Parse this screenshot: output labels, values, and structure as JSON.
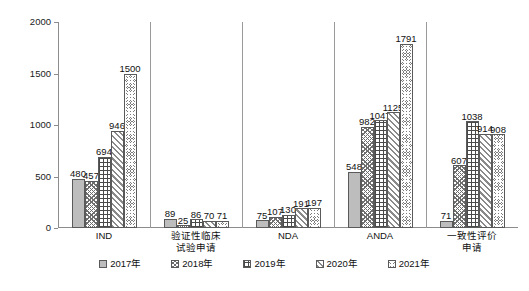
{
  "chart_data": {
    "type": "bar",
    "title": "",
    "xlabel": "",
    "ylabel": "",
    "ylim": [
      0,
      2000
    ],
    "yticks": [
      "0",
      "500",
      "1000",
      "1500",
      "2000"
    ],
    "grid": false,
    "legend_position": "bottom",
    "categories": [
      "IND",
      "验证性临床\n试验申请",
      "NDA",
      "ANDA",
      "一致性评价\n申请"
    ],
    "category_lines": [
      [
        "IND"
      ],
      [
        "验证性临床",
        "试验申请"
      ],
      [
        "NDA"
      ],
      [
        "ANDA"
      ],
      [
        "一致性评价",
        "申请"
      ]
    ],
    "series": [
      {
        "name": "2017年",
        "values": [
          480,
          89,
          75,
          548,
          71
        ]
      },
      {
        "name": "2018年",
        "values": [
          457,
          25,
          107,
          982,
          607
        ]
      },
      {
        "name": "2019年",
        "values": [
          694,
          86,
          130,
          1047,
          1038
        ]
      },
      {
        "name": "2020年",
        "values": [
          946,
          70,
          191,
          1125,
          914
        ]
      },
      {
        "name": "2021年",
        "values": [
          1500,
          71,
          197,
          1791,
          908
        ]
      }
    ]
  },
  "colors": {
    "series_2017": "#bdbdbd",
    "series_2018": "#6e6e6e",
    "series_2019": "#4a4a4a",
    "series_2020": "#8a8a8a",
    "series_2021": "#7d7d7d",
    "axis": "#8c8c8c",
    "text": "#1a1a1a",
    "background": "#ffffff"
  }
}
